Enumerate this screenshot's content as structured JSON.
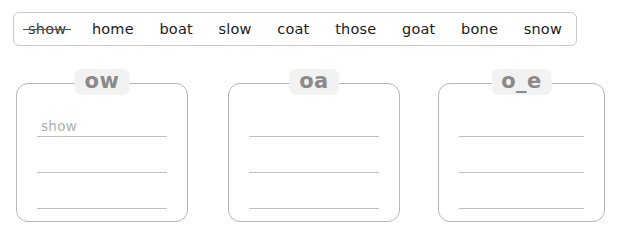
{
  "page": {
    "background_color": "#ffffff",
    "type": "phonics-word-sort-worksheet"
  },
  "word_bank": {
    "border_color": "#c9c9c9",
    "words": [
      {
        "text": "show",
        "used": true
      },
      {
        "text": "home",
        "used": false
      },
      {
        "text": "boat",
        "used": false
      },
      {
        "text": "slow",
        "used": false
      },
      {
        "text": "coat",
        "used": false
      },
      {
        "text": "those",
        "used": false
      },
      {
        "text": "goat",
        "used": false
      },
      {
        "text": "bone",
        "used": false
      },
      {
        "text": "snow",
        "used": false
      }
    ]
  },
  "sort_boxes": [
    {
      "label": "ow",
      "label_bg": "#f2f2f2",
      "label_color": "#8a8a8a",
      "lines": [
        {
          "answer": "show"
        },
        {
          "answer": ""
        },
        {
          "answer": ""
        }
      ]
    },
    {
      "label": "oa",
      "label_bg": "#f2f2f2",
      "label_color": "#8a8a8a",
      "lines": [
        {
          "answer": ""
        },
        {
          "answer": ""
        },
        {
          "answer": ""
        }
      ]
    },
    {
      "label": "o_e",
      "label_bg": "#f2f2f2",
      "label_color": "#8a8a8a",
      "lines": [
        {
          "answer": ""
        },
        {
          "answer": ""
        },
        {
          "answer": ""
        }
      ]
    }
  ]
}
